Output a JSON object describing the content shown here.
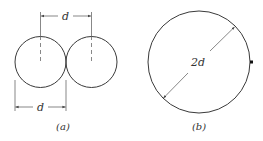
{
  "figure_a": {
    "caption": "(a)",
    "circles": [
      {
        "cx": 40.5,
        "cy": 62,
        "r": 25.5
      },
      {
        "cx": 91.5,
        "cy": 62,
        "r": 25.5
      }
    ],
    "top_dimension_label": "d",
    "bottom_dimension_label": "d"
  },
  "figure_b": {
    "caption": "(b)",
    "circle": {
      "cx": 199,
      "cy": 62,
      "r": 51
    },
    "diameter_label": "2d"
  },
  "colors": {
    "line": "#3a3a3a",
    "background": "#ffffff"
  }
}
